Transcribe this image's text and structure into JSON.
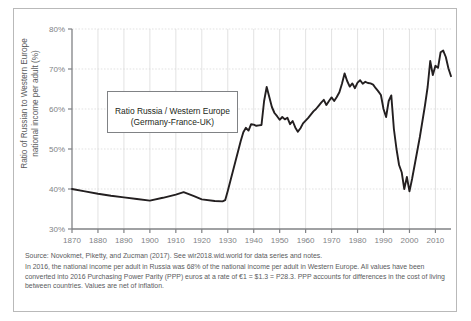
{
  "figure": {
    "ylabel": "Ratio of Russian to Western Europe\nnational income per adult (%)",
    "legend_label": "Ratio Russia / Western Europe\n(Germany-France-UK)",
    "footer_source": "Source: Novokmet, Piketty, and Zucman (2017). See wir2018.wid.world for data series and notes.",
    "footer_note": "In 2016, the national income per adult in Russia was 68% of the national income per adult in Western Europe. All values have been converted into 2016 Purchasing Power Parity (PPP) euros at a rate of €1 = $1.3 = P28.3. PPP accounts for differences in the cost of living between countries. Values are net of inflation.",
    "line_color": "#231f20",
    "grid_color": "#d6d6d6",
    "axis_color": "#808285",
    "border_color": "#b9b9b9"
  },
  "chart_data": {
    "type": "line",
    "title": "",
    "xlabel": "",
    "ylabel": "Ratio of Russian to Western Europe national income per adult (%)",
    "xlim": [
      1870,
      2016
    ],
    "ylim": [
      30,
      80
    ],
    "ytick_labels": [
      "30%",
      "40%",
      "50%",
      "60%",
      "70%",
      "80%"
    ],
    "yticks": [
      30,
      40,
      50,
      60,
      70,
      80
    ],
    "xticks": [
      1870,
      1880,
      1890,
      1900,
      1910,
      1920,
      1930,
      1940,
      1950,
      1960,
      1970,
      1980,
      1990,
      2000,
      2010
    ],
    "xtick_labels": [
      "1870",
      "1880",
      "1890",
      "1900",
      "1910",
      "1920",
      "1930",
      "1940",
      "1950",
      "1960",
      "1970",
      "1980",
      "1990",
      "2000",
      "2010"
    ],
    "grid": true,
    "legend_position": "inside-upper-left",
    "series": [
      {
        "name": "Ratio Russia / Western Europe (Germany-France-UK)",
        "color": "#231f20",
        "x": [
          1870,
          1875,
          1880,
          1885,
          1890,
          1895,
          1900,
          1905,
          1910,
          1913,
          1917,
          1920,
          1925,
          1928,
          1929,
          1930,
          1931,
          1932,
          1933,
          1934,
          1935,
          1936,
          1937,
          1938,
          1939,
          1940,
          1941,
          1942,
          1943,
          1944,
          1945,
          1946,
          1947,
          1948,
          1949,
          1950,
          1951,
          1952,
          1953,
          1954,
          1955,
          1956,
          1957,
          1958,
          1959,
          1960,
          1961,
          1962,
          1963,
          1964,
          1965,
          1966,
          1967,
          1968,
          1969,
          1970,
          1971,
          1972,
          1973,
          1974,
          1975,
          1976,
          1977,
          1978,
          1979,
          1980,
          1981,
          1982,
          1983,
          1984,
          1985,
          1986,
          1987,
          1988,
          1989,
          1990,
          1991,
          1992,
          1993,
          1994,
          1995,
          1996,
          1997,
          1998,
          1999,
          2000,
          2001,
          2002,
          2003,
          2004,
          2005,
          2006,
          2007,
          2008,
          2009,
          2010,
          2011,
          2012,
          2013,
          2014,
          2015,
          2016
        ],
        "values": [
          40.0,
          39.4,
          38.8,
          38.3,
          37.9,
          37.5,
          37.1,
          37.8,
          38.6,
          39.2,
          38.2,
          37.4,
          37.0,
          36.9,
          37.2,
          39.5,
          42.0,
          44.5,
          47.0,
          49.5,
          52.0,
          54.2,
          55.3,
          54.6,
          56.2,
          56.1,
          55.8,
          55.9,
          56.0,
          62.0,
          65.5,
          63.0,
          60.5,
          59.0,
          58.2,
          57.3,
          58.0,
          57.4,
          57.8,
          56.2,
          57.0,
          55.4,
          54.3,
          55.2,
          56.4,
          57.1,
          57.8,
          58.6,
          59.4,
          60.0,
          60.8,
          61.6,
          62.3,
          61.0,
          62.0,
          62.9,
          62.0,
          63.0,
          64.2,
          66.3,
          68.9,
          67.0,
          65.6,
          66.4,
          65.2,
          66.6,
          67.2,
          66.3,
          66.8,
          66.5,
          66.4,
          66.1,
          65.2,
          64.4,
          63.5,
          60.0,
          58.0,
          62.0,
          63.4,
          55.0,
          50.0,
          46.0,
          44.2,
          40.0,
          43.0,
          39.4,
          42.5,
          46.0,
          49.5,
          53.0,
          57.0,
          61.0,
          65.5,
          72.0,
          68.5,
          70.8,
          70.3,
          74.2,
          74.6,
          73.0,
          70.2,
          68.2
        ]
      }
    ]
  }
}
